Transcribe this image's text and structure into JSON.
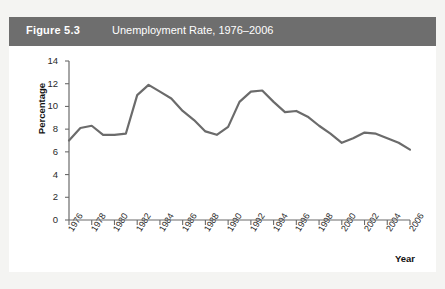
{
  "banner": {
    "figure_number": "Figure 5.3",
    "title": "Unemployment Rate, 1976–2006",
    "background_color": "#6e6e6e",
    "text_color": "#ffffff"
  },
  "chart_data": {
    "type": "line",
    "title": "Unemployment Rate, 1976–2006",
    "xlabel": "Year",
    "ylabel": "Percentage",
    "xlim": [
      1976,
      2006
    ],
    "ylim": [
      0,
      14
    ],
    "ytick_values": [
      0,
      2,
      4,
      6,
      8,
      10,
      12,
      14
    ],
    "ytick_labels": [
      "0",
      "2",
      "4",
      "6",
      "8",
      "10",
      "12",
      "14"
    ],
    "xtick_values": [
      1976,
      1978,
      1980,
      1982,
      1984,
      1986,
      1988,
      1990,
      1992,
      1994,
      1996,
      1998,
      2000,
      2002,
      2004,
      2006
    ],
    "xtick_labels": [
      "1976",
      "1978",
      "1980",
      "1982",
      "1984",
      "1986",
      "1988",
      "1990",
      "1992",
      "1994",
      "1996",
      "1998",
      "2000",
      "2002",
      "2004",
      "2006"
    ],
    "grid": false,
    "legend": null,
    "line_color": "#6b6b6b",
    "line_width": 2.2,
    "x": [
      1976,
      1977,
      1978,
      1979,
      1980,
      1981,
      1982,
      1983,
      1984,
      1985,
      1986,
      1987,
      1988,
      1989,
      1990,
      1991,
      1992,
      1993,
      1994,
      1995,
      1996,
      1997,
      1998,
      1999,
      2000,
      2001,
      2002,
      2003,
      2004,
      2005,
      2006
    ],
    "values": [
      7.0,
      8.1,
      8.3,
      7.5,
      7.5,
      7.6,
      11.0,
      11.9,
      11.3,
      10.7,
      9.6,
      8.8,
      7.8,
      7.5,
      8.2,
      10.4,
      11.3,
      11.4,
      10.4,
      9.5,
      9.6,
      9.1,
      8.3,
      7.6,
      6.8,
      7.2,
      7.7,
      7.6,
      7.2,
      6.8,
      6.2
    ]
  }
}
